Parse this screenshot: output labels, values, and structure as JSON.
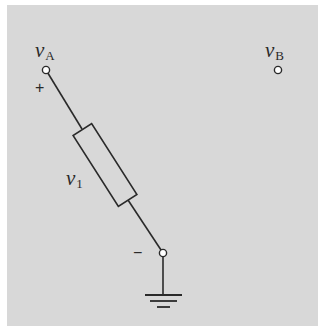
{
  "diagram": {
    "type": "circuit-schematic",
    "background_color": "#d8d8d8",
    "line_color": "#2a2a2a",
    "nodes": {
      "A": {
        "label_var": "v",
        "label_sub": "A",
        "x": 46,
        "y": 70
      },
      "B": {
        "label_var": "v",
        "label_sub": "B",
        "x": 278,
        "y": 70
      },
      "ground_node": {
        "x": 163,
        "y": 253
      }
    },
    "element": {
      "kind": "resistor",
      "label_var": "v",
      "label_sub": "1",
      "from": "A",
      "to": "ground_node"
    },
    "polarity": {
      "plus": "+",
      "minus": "−"
    },
    "ground": {
      "symbol": "ground"
    }
  }
}
